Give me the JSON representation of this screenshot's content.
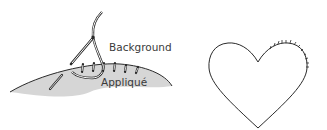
{
  "figures": [
    {
      "id": "applique-stitch",
      "labels": {
        "background": "Background",
        "applique": "Appliqué"
      },
      "colors": {
        "applique_fill": "#d6d6d6",
        "line": "#2a2a2a",
        "text": "#3a3a3a"
      }
    },
    {
      "id": "heart-outline",
      "colors": {
        "line": "#2a2a2a"
      }
    }
  ]
}
